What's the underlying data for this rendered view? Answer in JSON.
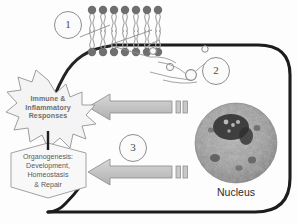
{
  "diagram": {
    "cell": {
      "membrane_color": "#1d1d1d",
      "interior_color": "#fdfdfd"
    },
    "steps": [
      {
        "id": "1",
        "label": "1",
        "describes": "phospholipid bilayer membrane"
      },
      {
        "id": "2",
        "label": "2",
        "describes": "released signaling vesicles"
      },
      {
        "id": "3",
        "label": "3",
        "describes": "downstream cellular response"
      }
    ],
    "nucleus": {
      "label": "Nucleus",
      "fill_color": "#9a9a9a"
    },
    "bilayer": {
      "head_color": "#7d7d7d",
      "tail_color": "#9e9e9e",
      "upper_leaflet_count": 7,
      "lower_leaflet_count": 7
    },
    "vesicles": {
      "outline_color": "#8a8a8a",
      "count": 4
    },
    "arrows": [
      {
        "id": "arrow-upper",
        "direction": "left",
        "fill_color": "#c4c4c4",
        "target": "Immune & Inflammatory Responses"
      },
      {
        "id": "arrow-lower",
        "direction": "left",
        "fill_color": "#c4c4c4",
        "target": "Organogenesis: Development, Homeostasis & Repair"
      }
    ],
    "outcomes": {
      "burst": {
        "shape": "starburst",
        "fill_color": "#f2f2f2",
        "stroke_color": "#9d9d9d",
        "line1": "Immune &",
        "line2": "Inflammatory",
        "line3": "Responses"
      },
      "hexagon": {
        "shape": "hexagon",
        "fill_color": "#f7f7f7",
        "stroke_color": "#a2a2a2",
        "line1": "Organogenesis:",
        "line2": "Development,",
        "line3": "Homeostasis",
        "line4": "& Repair"
      }
    }
  }
}
